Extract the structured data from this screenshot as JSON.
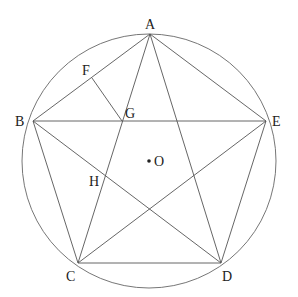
{
  "diagram": {
    "labels": {
      "A": "A",
      "B": "B",
      "C": "C",
      "D": "D",
      "E": "E",
      "F": "F",
      "G": "G",
      "H": "H",
      "O": "O"
    },
    "colors": {
      "line": "#555555",
      "text": "#222222"
    }
  }
}
